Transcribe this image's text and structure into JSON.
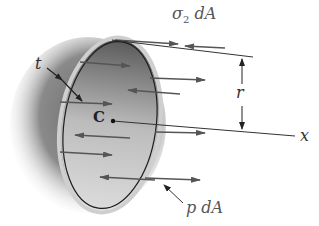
{
  "figure": {
    "labels": {
      "sigma_dA": "σ",
      "sigma_sub": "2",
      "sigma_tail": " dA",
      "thickness": "t",
      "radius": "r",
      "center": "C",
      "axis": "x",
      "pressure": "p dA"
    },
    "colors": {
      "shell_dark": "#3a3a3a",
      "shell_light": "#e6e6e6",
      "rim": "#bdbdbd",
      "arrow": "#555555",
      "text": "#555555"
    }
  }
}
